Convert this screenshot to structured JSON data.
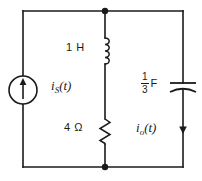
{
  "figure": {
    "name": "circuit-schematic",
    "type": "electrical-circuit-diagram",
    "background_color": "#ffffff",
    "line_color": "#1a1a1a"
  },
  "components": {
    "source": {
      "kind": "independent-current-source",
      "symbol": "circle-with-up-arrow",
      "arrow_direction": "up",
      "label_base": "i",
      "label_subscript": "S",
      "label_arg": "(t)",
      "label_full": "iS(t)"
    },
    "inductor": {
      "kind": "inductor",
      "symbol": "coil",
      "value": "1",
      "unit": "H",
      "label_full": "1 H",
      "turns": 4
    },
    "resistor": {
      "kind": "resistor",
      "symbol": "zigzag",
      "value": "4",
      "unit": "Ω",
      "label_full": "4 Ω",
      "zigzag_peaks": 6
    },
    "capacitor": {
      "kind": "capacitor",
      "symbol": "parallel-plates",
      "numerator": "1",
      "denominator": "3",
      "unit": "F",
      "label_full": "1/3 F"
    },
    "output_current": {
      "kind": "current-annotation",
      "arrow_direction": "down",
      "label_base": "i",
      "label_subscript": "o",
      "label_arg": "(t)",
      "label_full": "io(t)"
    }
  },
  "nodes": [
    {
      "name": "top-node",
      "x": 105,
      "y": 11
    },
    {
      "name": "bottom-node",
      "x": 105,
      "y": 167
    }
  ]
}
